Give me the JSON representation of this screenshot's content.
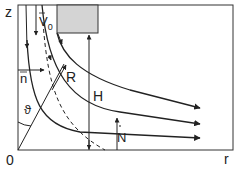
{
  "figure": {
    "type": "flow-diagram",
    "axes": {
      "vertical_label": "z",
      "horizontal_label": "r",
      "origin_label": "0"
    },
    "labels": {
      "velocity": "V 0",
      "velocity_base": "V",
      "velocity_sub": "0",
      "normal": "n",
      "radius": "R",
      "height": "H",
      "angle": "ϑ",
      "flux": "N"
    },
    "colors": {
      "line": "#222222",
      "block_fill": "#d4d4d4",
      "block_stroke": "#333333",
      "background": "#ffffff"
    }
  }
}
